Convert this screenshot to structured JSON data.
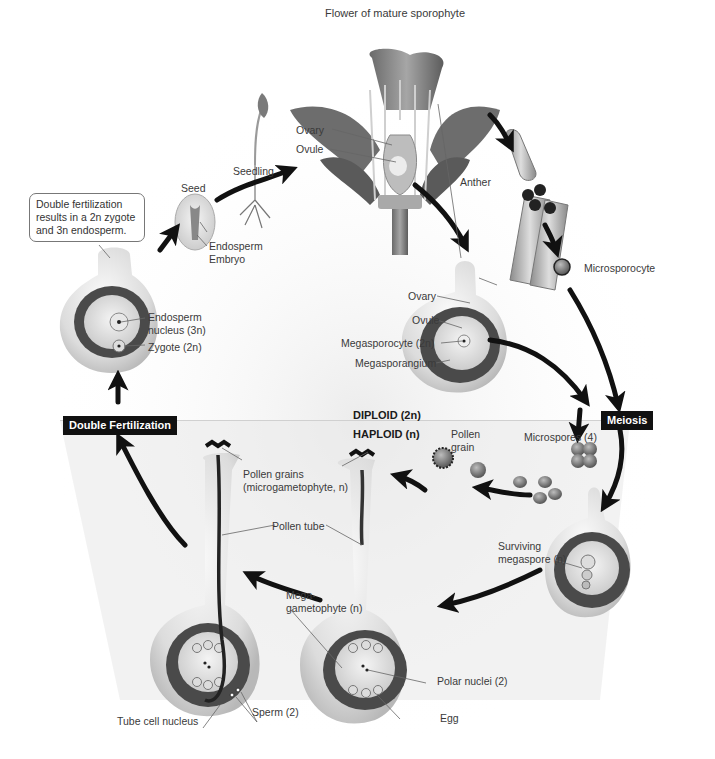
{
  "title": "Flower of mature sporophyte",
  "callout": {
    "line1": "Double fertilization",
    "line2": "results in a 2n zygote",
    "line3": "and 3n endosperm."
  },
  "ploidy": {
    "diploid": "DIPLOID (2n)",
    "haploid": "HAPLOID (n)"
  },
  "stage_tags": {
    "double_fertilization": "Double Fertilization",
    "meiosis": "Meiosis"
  },
  "labels": {
    "seedling": "Seedling",
    "seed": "Seed",
    "endosperm": "Endosperm",
    "embryo": "Embryo",
    "flower_ovary": "Ovary",
    "flower_ovule": "Ovule",
    "anther": "Anther",
    "microsporocyte": "Microsporocyte",
    "endosperm_nucleus_1": "Endosperm",
    "endosperm_nucleus_2": "nucleus (3n)",
    "zygote": "Zygote (2n)",
    "ovary": "Ovary",
    "ovule": "Ovule",
    "megasporocyte": "Megasporocyte (2n)",
    "megasporangium": "Megasporangium",
    "pollen_grain_1": "Pollen",
    "pollen_grain_2": "grain",
    "microspores": "Microspores (4)",
    "pollen_grains_1": "Pollen grains",
    "pollen_grains_2": "(microgametophyte, n)",
    "pollen_tube": "Pollen tube",
    "surviving_megaspore_1": "Surviving",
    "surviving_megaspore_2": "megaspore (n)",
    "megagametophyte_1": "Mega-",
    "megagametophyte_2": "gametophyte (n)",
    "polar_nuclei": "Polar nuclei (2)",
    "egg": "Egg",
    "tube_cell_nucleus": "Tube cell nucleus",
    "sperm": "Sperm (2)"
  },
  "colors": {
    "diploid_bg": "#f2f2f2",
    "haploid_bg": "#e6e6e6",
    "arrow": "#111111",
    "tag_bg": "#111111",
    "ovule_dark": "#4a4a4a",
    "ovule_light": "#d9d9d9"
  }
}
